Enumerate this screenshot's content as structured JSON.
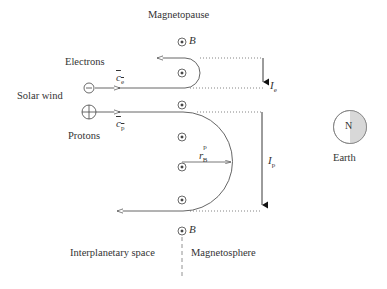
{
  "labels": {
    "magnetopause": "Magnetopause",
    "electrons": "Electrons",
    "solar_wind": "Solar wind",
    "protons": "Protons",
    "earth": "Earth",
    "earth_pole": "N",
    "interplanetary_space": "Interplanetary space",
    "magnetosphere": "Magnetosphere"
  },
  "symbols": {
    "field_top": "B",
    "field_bottom": "B",
    "electron_velocity": "c",
    "electron_velocity_sub": "e",
    "proton_velocity": "c",
    "proton_velocity_sub": "p",
    "electron_current": "I",
    "electron_current_sub": "e",
    "proton_current": "I",
    "proton_current_sub": "p",
    "gyroradius": "r",
    "gyroradius_sub": "B",
    "gyroradius_sup": "p"
  },
  "particles": {
    "electron_charge": "−",
    "proton_charge": "+"
  },
  "colors": {
    "line": "#555555",
    "text": "#333333",
    "earth_shade": "#d8d8d8"
  }
}
